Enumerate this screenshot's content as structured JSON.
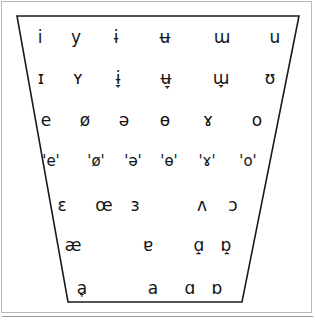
{
  "figure": {
    "name": "ipa-vowel-quadrilateral",
    "background_color": "#ffffff",
    "ink_color": "#141414",
    "frame_color": "#b9b9b9"
  },
  "chart_data": {
    "type": "scatter",
    "title": "",
    "xlabel": "",
    "ylabel": "",
    "grid": false,
    "legend": null,
    "shape": "trapezoid",
    "rows": [
      {
        "id": "close",
        "y": 37,
        "cells": [
          {
            "symbol": "i",
            "x": 40
          },
          {
            "symbol": "y",
            "x": 76
          },
          {
            "symbol": "ɨ",
            "x": 116
          },
          {
            "symbol": "ʉ",
            "x": 165
          },
          {
            "symbol": "ɯ",
            "x": 222
          },
          {
            "symbol": "u",
            "x": 275
          }
        ]
      },
      {
        "id": "near-close",
        "y": 78,
        "cells": [
          {
            "symbol": "ɪ",
            "x": 41
          },
          {
            "symbol": "ʏ",
            "x": 78
          },
          {
            "symbol": "ɨ̞",
            "x": 118
          },
          {
            "symbol": "ʉ̞",
            "x": 166
          },
          {
            "symbol": "ɯ̞",
            "x": 221
          },
          {
            "symbol": "ʊ",
            "x": 270
          }
        ]
      },
      {
        "id": "close-mid",
        "y": 120,
        "cells": [
          {
            "symbol": "e",
            "x": 46
          },
          {
            "symbol": "ø",
            "x": 85
          },
          {
            "symbol": "ə",
            "x": 124
          },
          {
            "symbol": "ɵ",
            "x": 165
          },
          {
            "symbol": "ɤ",
            "x": 208
          },
          {
            "symbol": "o",
            "x": 257
          }
        ]
      },
      {
        "id": "mid",
        "y": 161,
        "cells": [
          {
            "symbol": "'e'",
            "x": 51
          },
          {
            "symbol": "'ø'",
            "x": 96
          },
          {
            "symbol": "'ə'",
            "x": 133
          },
          {
            "symbol": "'ɵ'",
            "x": 169
          },
          {
            "symbol": "'ɤ'",
            "x": 207
          },
          {
            "symbol": "'o'",
            "x": 248
          }
        ]
      },
      {
        "id": "open-mid",
        "y": 205,
        "cells": [
          {
            "symbol": "ɛ",
            "x": 62
          },
          {
            "symbol": "œ",
            "x": 104
          },
          {
            "symbol": "ɜ",
            "x": 135
          },
          {
            "symbol": "ʌ",
            "x": 202
          },
          {
            "symbol": "ɔ",
            "x": 233
          }
        ]
      },
      {
        "id": "near-open",
        "y": 245,
        "cells": [
          {
            "symbol": "æ",
            "x": 73
          },
          {
            "symbol": "ɐ",
            "x": 148
          },
          {
            "symbol": "ɑ̝",
            "x": 199
          },
          {
            "symbol": "ɒ̝",
            "x": 226
          }
        ]
      },
      {
        "id": "open",
        "y": 288,
        "cells": [
          {
            "symbol": "a̟",
            "x": 82
          },
          {
            "symbol": "a",
            "x": 153
          },
          {
            "symbol": "ɑ",
            "x": 190
          },
          {
            "symbol": "ɒ",
            "x": 217
          }
        ]
      }
    ]
  }
}
